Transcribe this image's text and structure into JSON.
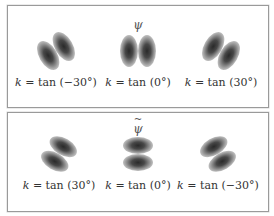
{
  "panels": [
    {
      "title": "ψ",
      "title_has_tilde": false,
      "items": [
        {
          "k_symbol": "k",
          "equals": "=",
          "func": "tan",
          "angle": "(−30°)",
          "lobe_split": "vertical",
          "tilt_deg": -30
        },
        {
          "k_symbol": "k",
          "equals": "=",
          "func": "tan",
          "angle": "(0°)",
          "lobe_split": "vertical",
          "tilt_deg": 0
        },
        {
          "k_symbol": "k",
          "equals": "=",
          "func": "tan",
          "angle": "(30°)",
          "lobe_split": "vertical",
          "tilt_deg": 30
        }
      ]
    },
    {
      "title": "ψ",
      "title_has_tilde": true,
      "items": [
        {
          "k_symbol": "k",
          "equals": "=",
          "func": "tan",
          "angle": "(30°)",
          "lobe_split": "horizontal",
          "tilt_deg": 30
        },
        {
          "k_symbol": "k",
          "equals": "=",
          "func": "tan",
          "angle": "(0°)",
          "lobe_split": "horizontal",
          "tilt_deg": 0
        },
        {
          "k_symbol": "k",
          "equals": "=",
          "func": "tan",
          "angle": "(−30°)",
          "lobe_split": "horizontal",
          "tilt_deg": -30
        }
      ]
    }
  ]
}
